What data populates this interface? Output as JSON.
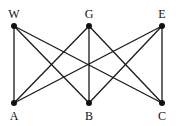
{
  "graph": {
    "type": "bipartite-K3,3",
    "nodes": [
      {
        "id": "W",
        "label": "W",
        "x": 14,
        "y": 26,
        "label_x": 14,
        "label_y": 8
      },
      {
        "id": "G",
        "label": "G",
        "x": 89,
        "y": 26,
        "label_x": 89,
        "label_y": 8
      },
      {
        "id": "E",
        "label": "E",
        "x": 162,
        "y": 26,
        "label_x": 162,
        "label_y": 8
      },
      {
        "id": "A",
        "label": "A",
        "x": 14,
        "y": 103,
        "label_x": 14,
        "label_y": 110
      },
      {
        "id": "B",
        "label": "B",
        "x": 89,
        "y": 103,
        "label_x": 89,
        "label_y": 110
      },
      {
        "id": "C",
        "label": "C",
        "x": 162,
        "y": 103,
        "label_x": 162,
        "label_y": 110
      }
    ],
    "edges": [
      [
        "W",
        "A"
      ],
      [
        "W",
        "B"
      ],
      [
        "W",
        "C"
      ],
      [
        "G",
        "A"
      ],
      [
        "G",
        "B"
      ],
      [
        "G",
        "C"
      ],
      [
        "E",
        "A"
      ],
      [
        "E",
        "B"
      ],
      [
        "E",
        "C"
      ]
    ],
    "colors": {
      "edge": "#1a1a1a",
      "node": "#111111"
    }
  }
}
